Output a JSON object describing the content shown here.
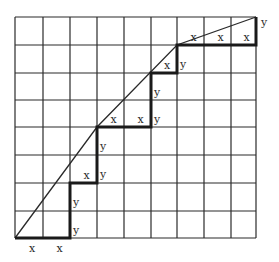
{
  "diagram": {
    "type": "staircase-approximation-grid",
    "grid": {
      "columns": 9,
      "rows": 8,
      "x_lines_px": [
        15,
        43,
        70,
        97,
        124,
        151,
        177,
        204,
        231,
        256
      ],
      "y_lines_px": [
        17,
        45,
        73,
        100,
        127,
        155,
        183,
        211,
        238
      ],
      "line_color": "#2a2a2a"
    },
    "curve_points": [
      [
        0,
        0
      ],
      [
        3,
        4
      ],
      [
        6,
        7
      ],
      [
        9,
        8
      ]
    ],
    "staircase_points": [
      [
        0,
        0
      ],
      [
        2,
        0
      ],
      [
        2,
        2
      ],
      [
        3,
        2
      ],
      [
        3,
        4
      ],
      [
        5,
        4
      ],
      [
        5,
        6
      ],
      [
        6,
        6
      ],
      [
        6,
        7
      ],
      [
        9,
        7
      ],
      [
        9,
        8
      ]
    ],
    "step_labels": [
      {
        "text": "x",
        "step": "h",
        "col": 0,
        "row": 0,
        "below": true
      },
      {
        "text": "x",
        "step": "h",
        "col": 1,
        "row": 0,
        "below": true
      },
      {
        "text": "y",
        "step": "v",
        "col": 2,
        "row": 0
      },
      {
        "text": "y",
        "step": "v",
        "col": 2,
        "row": 1
      },
      {
        "text": "x",
        "step": "h",
        "col": 2,
        "row": 2
      },
      {
        "text": "y",
        "step": "v",
        "col": 3,
        "row": 2
      },
      {
        "text": "y",
        "step": "v",
        "col": 3,
        "row": 3
      },
      {
        "text": "x",
        "step": "h",
        "col": 3,
        "row": 4
      },
      {
        "text": "x",
        "step": "h",
        "col": 4,
        "row": 4
      },
      {
        "text": "y",
        "step": "v",
        "col": 5,
        "row": 4
      },
      {
        "text": "y",
        "step": "v",
        "col": 5,
        "row": 5
      },
      {
        "text": "x",
        "step": "h",
        "col": 5,
        "row": 6
      },
      {
        "text": "y",
        "step": "v",
        "col": 6,
        "row": 6
      },
      {
        "text": "x",
        "step": "h",
        "col": 6,
        "row": 7
      },
      {
        "text": "x",
        "step": "h",
        "col": 7,
        "row": 7
      },
      {
        "text": "x",
        "step": "h",
        "col": 8,
        "row": 7
      },
      {
        "text": "y",
        "step": "v",
        "col": 9,
        "row": 7
      }
    ]
  }
}
